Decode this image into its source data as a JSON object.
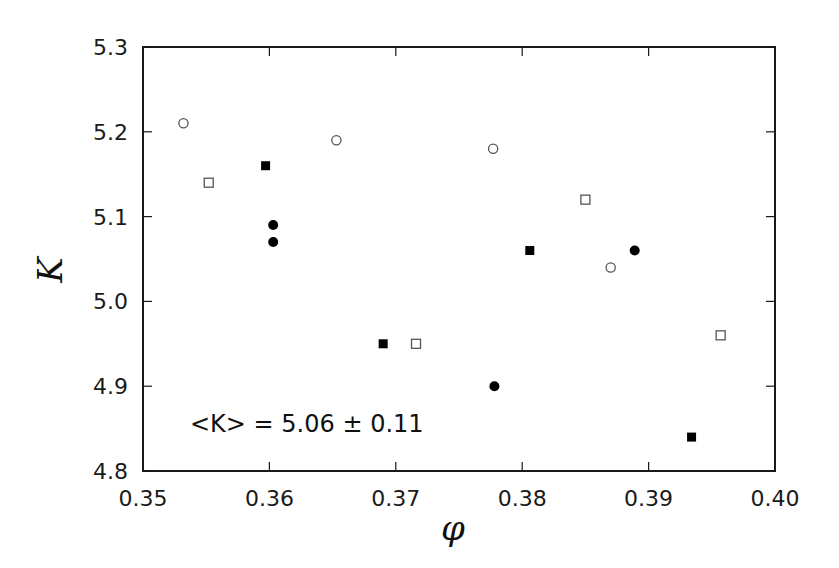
{
  "chart_data": {
    "type": "scatter",
    "title": "",
    "xlabel": "φ",
    "ylabel": "K",
    "xlim": [
      0.35,
      0.4
    ],
    "ylim": [
      4.8,
      5.3
    ],
    "x_ticks": [
      "0.35",
      "0.36",
      "0.37",
      "0.38",
      "0.39",
      "0.40"
    ],
    "y_ticks": [
      "4.8",
      "4.9",
      "5.0",
      "5.1",
      "5.2",
      "5.3"
    ],
    "grid": false,
    "legend": null,
    "annotation": "<K> = 5.06 ± 0.11",
    "series": [
      {
        "name": "open-circle",
        "marker": "circle",
        "filled": false,
        "points": [
          [
            0.3532,
            5.21
          ],
          [
            0.3653,
            5.19
          ],
          [
            0.3777,
            5.18
          ],
          [
            0.387,
            5.04
          ]
        ]
      },
      {
        "name": "open-square",
        "marker": "square",
        "filled": false,
        "points": [
          [
            0.3552,
            5.14
          ],
          [
            0.385,
            5.12
          ],
          [
            0.3716,
            4.95
          ],
          [
            0.3957,
            4.96
          ]
        ]
      },
      {
        "name": "filled-square",
        "marker": "square",
        "filled": true,
        "points": [
          [
            0.3597,
            5.16
          ],
          [
            0.3806,
            5.06
          ],
          [
            0.369,
            4.95
          ],
          [
            0.3934,
            4.84
          ]
        ]
      },
      {
        "name": "filled-circle",
        "marker": "circle",
        "filled": true,
        "points": [
          [
            0.3603,
            5.09
          ],
          [
            0.3603,
            5.07
          ],
          [
            0.3889,
            5.06
          ],
          [
            0.3778,
            4.9
          ]
        ]
      }
    ]
  },
  "colors": {
    "axis": "#1a1a1a",
    "filled_marker": "#000000",
    "open_marker_stroke": "#555555"
  }
}
